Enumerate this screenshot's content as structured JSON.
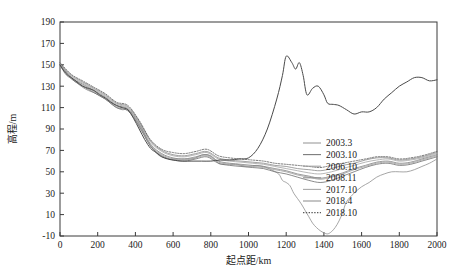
{
  "chart_data": {
    "type": "line",
    "title": "",
    "xlabel": "起点距/km",
    "ylabel": "高程/m",
    "xlim": [
      0,
      2000
    ],
    "ylim": [
      -10,
      190
    ],
    "xticks": [
      0,
      200,
      400,
      600,
      800,
      1000,
      1200,
      1400,
      1600,
      1800,
      2000
    ],
    "yticks": [
      -10,
      10,
      30,
      50,
      70,
      90,
      110,
      130,
      150,
      170,
      190
    ],
    "grid": false,
    "legend_position": "center-right",
    "legend_entries": [
      "2003.3",
      "2003.10",
      "2006.10",
      "2008.11",
      "2017.10",
      "2018.4",
      "2018.10"
    ],
    "colors": {
      "2003.3": "#8f8f8f",
      "2003.10": "#6d6d6d",
      "2006.10": "#9a9a9a",
      "2008.11": "#828282",
      "2017.10": "#a3a3a3",
      "2018.4": "#8a8a8a",
      "2018.10": "#555555",
      "axis": "#3a3a3a"
    },
    "series": [
      {
        "name": "2003.3",
        "style": "solid",
        "color": "#8f8f8f",
        "x": [
          0,
          30,
          60,
          90,
          120,
          150,
          180,
          210,
          240,
          270,
          300,
          330,
          360,
          390,
          420,
          450,
          480,
          500,
          520,
          540,
          560,
          580,
          600,
          620,
          640,
          660,
          680,
          700,
          720,
          740,
          760,
          780,
          800,
          820,
          840,
          860,
          880,
          900,
          920,
          940,
          960,
          980,
          1000,
          1040,
          1080,
          1120,
          1160,
          1180,
          1200,
          1220,
          1240,
          1260,
          1280,
          1300,
          1320,
          1340,
          1360,
          1380,
          1400,
          1420,
          1440,
          1460,
          1480,
          1500,
          1520,
          1560,
          1600,
          1640,
          1680,
          1720,
          1760,
          1800,
          1840,
          1880,
          1920,
          1960,
          2000
        ],
        "y": [
          150,
          141,
          137,
          133,
          129,
          126,
          124,
          121,
          118,
          114,
          110,
          108,
          108,
          101,
          92,
          83,
          74,
          70,
          66,
          64,
          63,
          62,
          62,
          62,
          62,
          62,
          62,
          62,
          63,
          65,
          66,
          66,
          65,
          62,
          58,
          57,
          57,
          57,
          57,
          57,
          56,
          55,
          55,
          56,
          55,
          52,
          48,
          42,
          40,
          37,
          30,
          25,
          20,
          14,
          8,
          2,
          -2,
          -5,
          -7,
          -8,
          -6,
          -2,
          4,
          12,
          22,
          30,
          36,
          40,
          45,
          48,
          50,
          50,
          50,
          52,
          55,
          58,
          62
        ],
        "note": "deepest scour pit, minimum about -8 m near 1420 km in pixel-space trough"
      },
      {
        "name": "2003.10",
        "style": "solid",
        "color": "#6d6d6d",
        "x": [
          0,
          60,
          120,
          180,
          240,
          300,
          360,
          420,
          480,
          540,
          600,
          660,
          720,
          780,
          840,
          900,
          960,
          1020,
          1080,
          1140,
          1200,
          1260,
          1320,
          1380,
          1440,
          1500,
          1560,
          1620,
          1680,
          1740,
          1800,
          1860,
          1920,
          1980,
          2000
        ],
        "y": [
          149,
          137,
          130,
          124,
          118,
          110,
          107,
          93,
          74,
          65,
          61,
          60,
          62,
          64,
          58,
          56,
          55,
          54,
          53,
          50,
          48,
          45,
          42,
          40,
          42,
          46,
          50,
          54,
          57,
          58,
          56,
          57,
          60,
          63,
          64
        ]
      },
      {
        "name": "2006.10",
        "style": "solid",
        "color": "#9a9a9a",
        "x": [
          0,
          60,
          120,
          180,
          240,
          300,
          360,
          420,
          480,
          540,
          600,
          660,
          720,
          780,
          840,
          900,
          960,
          1020,
          1080,
          1140,
          1200,
          1260,
          1320,
          1380,
          1440,
          1500,
          1560,
          1620,
          1680,
          1740,
          1800,
          1860,
          1920,
          1980,
          2000
        ],
        "y": [
          150,
          138,
          131,
          125,
          119,
          111,
          108,
          94,
          75,
          66,
          62,
          61,
          63,
          65,
          59,
          57,
          56,
          55,
          54,
          52,
          50,
          47,
          45,
          43,
          45,
          48,
          52,
          55,
          58,
          59,
          57,
          58,
          61,
          64,
          65
        ]
      },
      {
        "name": "2008.11",
        "style": "solid",
        "color": "#828282",
        "x": [
          0,
          60,
          120,
          180,
          240,
          300,
          360,
          420,
          480,
          540,
          600,
          660,
          720,
          780,
          840,
          900,
          960,
          1020,
          1080,
          1140,
          1200,
          1260,
          1320,
          1380,
          1440,
          1500,
          1560,
          1620,
          1680,
          1740,
          1800,
          1860,
          1920,
          1980,
          2000
        ],
        "y": [
          150,
          138,
          132,
          126,
          120,
          112,
          109,
          95,
          76,
          67,
          63,
          62,
          64,
          66,
          60,
          58,
          57,
          56,
          55,
          53,
          51,
          48,
          46,
          44,
          46,
          49,
          53,
          56,
          59,
          60,
          58,
          59,
          62,
          65,
          66
        ]
      },
      {
        "name": "2017.10",
        "style": "solid",
        "color": "#a3a3a3",
        "x": [
          0,
          60,
          120,
          180,
          240,
          300,
          360,
          420,
          480,
          540,
          600,
          660,
          720,
          780,
          840,
          900,
          960,
          1020,
          1080,
          1140,
          1200,
          1260,
          1320,
          1380,
          1440,
          1500,
          1560,
          1620,
          1680,
          1740,
          1800,
          1860,
          1920,
          1980,
          2000
        ],
        "y": [
          151,
          139,
          133,
          127,
          121,
          113,
          110,
          96,
          78,
          69,
          65,
          64,
          66,
          68,
          62,
          60,
          59,
          58,
          57,
          55,
          53,
          51,
          49,
          48,
          50,
          53,
          56,
          59,
          61,
          62,
          60,
          61,
          63,
          66,
          67
        ]
      },
      {
        "name": "2018.4",
        "style": "solid",
        "color": "#8a8a8a",
        "x": [
          0,
          60,
          120,
          180,
          240,
          300,
          360,
          420,
          480,
          540,
          600,
          660,
          720,
          780,
          840,
          900,
          960,
          1020,
          1080,
          1140,
          1200,
          1260,
          1320,
          1380,
          1440,
          1500,
          1560,
          1620,
          1680,
          1740,
          1800,
          1860,
          1920,
          1980,
          2000
        ],
        "y": [
          151,
          140,
          134,
          128,
          122,
          114,
          111,
          97,
          79,
          70,
          66,
          65,
          67,
          69,
          63,
          61,
          60,
          59,
          58,
          56,
          55,
          53,
          52,
          51,
          53,
          56,
          58,
          61,
          63,
          63,
          61,
          62,
          64,
          67,
          68
        ]
      },
      {
        "name": "2018.10",
        "style": "dotted",
        "color": "#555555",
        "x": [
          0,
          60,
          120,
          180,
          240,
          300,
          360,
          420,
          480,
          540,
          600,
          660,
          720,
          780,
          840,
          900,
          960,
          1020,
          1080,
          1140,
          1200,
          1260,
          1320,
          1380,
          1440,
          1500,
          1560,
          1620,
          1680,
          1740,
          1800,
          1860,
          1920,
          1980,
          2000
        ],
        "y": [
          152,
          141,
          135,
          129,
          123,
          115,
          112,
          98,
          80,
          71,
          68,
          67,
          69,
          71,
          65,
          63,
          62,
          61,
          60,
          58,
          57,
          56,
          55,
          54,
          56,
          58,
          60,
          62,
          64,
          64,
          62,
          63,
          65,
          68,
          69
        ]
      },
      {
        "name": "profile-envelope",
        "style": "solid-dark",
        "color": "#4a4a4a",
        "comment": "overall terrain line: steep left bank from 150 m at 0 km down to about 55 m at 500 km, flat channel bed 55-62 m from 500-1000 km, rise to peak 160 m at 1200 km, secondary peak 150 m at 1270 km, shoulder 132 m at 1400 km, dip to 110 m at 1550-1700 km, rise to 138 m at 1950 km",
        "x": [
          0,
          30,
          60,
          90,
          120,
          150,
          180,
          210,
          240,
          270,
          300,
          330,
          360,
          390,
          420,
          450,
          480,
          510,
          540,
          570,
          600,
          650,
          700,
          750,
          800,
          850,
          900,
          950,
          1000,
          1050,
          1100,
          1150,
          1180,
          1200,
          1230,
          1250,
          1270,
          1290,
          1310,
          1340,
          1370,
          1400,
          1420,
          1450,
          1480,
          1520,
          1560,
          1600,
          1640,
          1680,
          1720,
          1760,
          1800,
          1840,
          1880,
          1920,
          1960,
          2000
        ],
        "y": [
          150,
          142,
          138,
          134,
          130,
          128,
          126,
          122,
          119,
          115,
          112,
          110,
          108,
          100,
          90,
          80,
          72,
          68,
          64,
          62,
          61,
          60,
          60,
          60,
          60,
          61,
          61,
          62,
          63,
          72,
          90,
          118,
          140,
          158,
          152,
          146,
          152,
          140,
          122,
          128,
          130,
          122,
          114,
          113,
          112,
          108,
          104,
          106,
          106,
          110,
          118,
          124,
          130,
          134,
          138,
          138,
          135,
          136
        ]
      }
    ]
  },
  "axes": {
    "y_axis_label": "高程/m",
    "x_axis_label": "起点距/km",
    "y_tick_labels": [
      "190",
      "170",
      "150",
      "130",
      "110",
      "90",
      "70",
      "50",
      "30",
      "10",
      "-10"
    ],
    "x_tick_labels": [
      "0",
      "200",
      "400",
      "600",
      "800",
      "1000",
      "1200",
      "1400",
      "1600",
      "1800",
      "2000"
    ]
  },
  "legend": {
    "items": [
      {
        "label": "2003.3",
        "dash": "none",
        "color": "#9b9b9b"
      },
      {
        "label": "2003.10",
        "dash": "none",
        "color": "#7a7a7a"
      },
      {
        "label": "2006.10",
        "dash": "none",
        "color": "#a0a0a0"
      },
      {
        "label": "2008.11",
        "dash": "none",
        "color": "#8d8d8d"
      },
      {
        "label": "2017.10",
        "dash": "none",
        "color": "#a8a8a8"
      },
      {
        "label": "2018.4",
        "dash": "none",
        "color": "#949494"
      },
      {
        "label": "2018.10",
        "dash": "dotted",
        "color": "#5a5a5a"
      }
    ]
  }
}
